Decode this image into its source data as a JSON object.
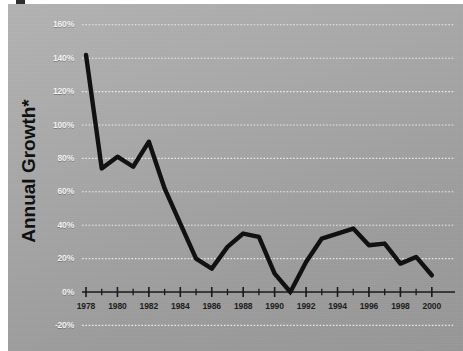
{
  "chart_data": {
    "type": "line",
    "title": "",
    "xlabel": "",
    "ylabel": "Annual Growth*",
    "ylim": [
      -20,
      160
    ],
    "xlim": [
      1978,
      2000
    ],
    "grid": true,
    "legend": false,
    "y_ticks": [
      "160%",
      "140%",
      "120%",
      "100%",
      "80%",
      "60%",
      "40%",
      "20%",
      "0%",
      "-20%"
    ],
    "y_tick_values": [
      160,
      140,
      120,
      100,
      80,
      60,
      40,
      20,
      0,
      -20
    ],
    "x_ticks": [
      "1978",
      "1980",
      "1982",
      "1984",
      "1986",
      "1988",
      "1990",
      "1992",
      "1994",
      "1996",
      "1998",
      "2000"
    ],
    "x_tick_values": [
      1978,
      1980,
      1982,
      1984,
      1986,
      1988,
      1990,
      1992,
      1994,
      1996,
      1998,
      2000
    ],
    "x": [
      1978,
      1979,
      1980,
      1981,
      1982,
      1983,
      1984,
      1985,
      1986,
      1987,
      1988,
      1989,
      1990,
      1991,
      1992,
      1993,
      1994,
      1995,
      1996,
      1997,
      1998,
      1999,
      2000
    ],
    "values": [
      142,
      74,
      81,
      75,
      90,
      62,
      41,
      20,
      14,
      27,
      35,
      33,
      11,
      0,
      18,
      32,
      35,
      38,
      28,
      29,
      17,
      21,
      10
    ],
    "series_name": "Annual Growth",
    "line_color": "#111111",
    "grid_color": "#f0f0f0",
    "axis_color": "#1a1a1a",
    "background_color": "#a9a9a9"
  },
  "axis": {
    "y_title": "Annual Growth*"
  }
}
